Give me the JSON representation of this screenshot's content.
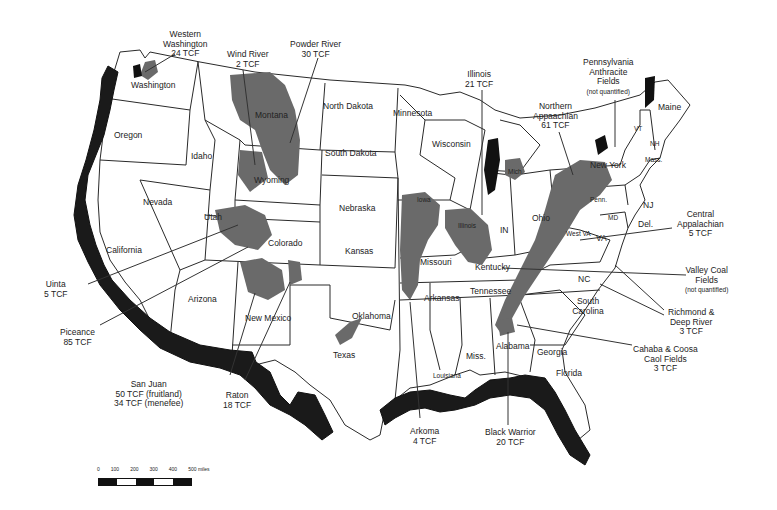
{
  "map": {
    "subject": "Coalbed methane basins of the conterminous United States",
    "states": [
      {
        "name": "Washington",
        "x": 137,
        "y": 83
      },
      {
        "name": "Oregon",
        "x": 114,
        "y": 134
      },
      {
        "name": "Idaho",
        "x": 191,
        "y": 151
      },
      {
        "name": "Montana",
        "x": 253,
        "y": 113
      },
      {
        "name": "Wyoming",
        "x": 254,
        "y": 177
      },
      {
        "name": "North Dakota",
        "x": 323,
        "y": 103
      },
      {
        "name": "South Dakota",
        "x": 325,
        "y": 150
      },
      {
        "name": "Minnesota",
        "x": 393,
        "y": 110
      },
      {
        "name": "Wisconsin",
        "x": 430,
        "y": 140
      },
      {
        "name": "Nevada",
        "x": 143,
        "y": 198
      },
      {
        "name": "Utah",
        "x": 204,
        "y": 215
      },
      {
        "name": "Colorado",
        "x": 268,
        "y": 240
      },
      {
        "name": "California",
        "x": 106,
        "y": 245
      },
      {
        "name": "Nebraska",
        "x": 339,
        "y": 205
      },
      {
        "name": "Kansas",
        "x": 345,
        "y": 248
      },
      {
        "name": "Iowa",
        "x": 417,
        "y": 196
      },
      {
        "name": "Illinois",
        "x": 458,
        "y": 222
      },
      {
        "name": "IN",
        "x": 500,
        "y": 225
      },
      {
        "name": "Ohio",
        "x": 532,
        "y": 213
      },
      {
        "name": "Missouri",
        "x": 420,
        "y": 259
      },
      {
        "name": "Kentucky",
        "x": 475,
        "y": 264
      },
      {
        "name": "Tennessee",
        "x": 470,
        "y": 288
      },
      {
        "name": "Arizona",
        "x": 188,
        "y": 297
      },
      {
        "name": "New Mexico",
        "x": 245,
        "y": 315
      },
      {
        "name": "Oklahoma",
        "x": 352,
        "y": 313
      },
      {
        "name": "Arkansas",
        "x": 424,
        "y": 295
      },
      {
        "name": "Texas",
        "x": 333,
        "y": 353
      },
      {
        "name": "Louisiana",
        "x": 433,
        "y": 372
      },
      {
        "name": "Miss.",
        "x": 470,
        "y": 353
      },
      {
        "name": "Alabama",
        "x": 501,
        "y": 344
      },
      {
        "name": "Georgia",
        "x": 537,
        "y": 350
      },
      {
        "name": "Florida",
        "x": 556,
        "y": 370
      },
      {
        "name": "South Carolina",
        "x": 567,
        "y": 299
      },
      {
        "name": "NC",
        "x": 578,
        "y": 275
      },
      {
        "name": "VA",
        "x": 594,
        "y": 234
      },
      {
        "name": "West VA",
        "x": 570,
        "y": 233
      },
      {
        "name": "Penn.",
        "x": 590,
        "y": 197
      },
      {
        "name": "New York",
        "x": 608,
        "y": 165
      },
      {
        "name": "MD",
        "x": 609,
        "y": 219
      },
      {
        "name": "Del.",
        "x": 638,
        "y": 220
      },
      {
        "name": "NJ",
        "x": 641,
        "y": 199
      },
      {
        "name": "VT",
        "x": 639,
        "y": 126
      },
      {
        "name": "NH",
        "x": 652,
        "y": 141
      },
      {
        "name": "Mass.",
        "x": 646,
        "y": 157
      },
      {
        "name": "Maine",
        "x": 667,
        "y": 105
      },
      {
        "name": "Mich.",
        "x": 510,
        "y": 170
      }
    ],
    "basins": [
      {
        "name": "Western Washington",
        "value": "24 TCF",
        "label_lines": [
          "Western",
          "Washington",
          "24 TCF"
        ]
      },
      {
        "name": "Wind River",
        "value": "2 TCF",
        "label_lines": [
          "Wind River",
          "2 TCF"
        ]
      },
      {
        "name": "Powder River",
        "value": "30 TCF",
        "label_lines": [
          "Powder River",
          "30 TCF"
        ]
      },
      {
        "name": "Illinois",
        "value": "21 TCF",
        "label_lines": [
          "Illinois",
          "21 TCF"
        ]
      },
      {
        "name": "Northern Appalachian",
        "value": "61 TCF",
        "label_lines": [
          "Northern",
          "Appaachian",
          "61 TCF"
        ]
      },
      {
        "name": "Pennsylvania Anthracite Fields",
        "value": "not quantified",
        "label_lines": [
          "Pennsylvania",
          "Anthracite",
          "Fields",
          "(not quantified)"
        ]
      },
      {
        "name": "Central Appalachian",
        "value": "5 TCF",
        "label_lines": [
          "Central",
          "Appalachian",
          "5 TCF"
        ]
      },
      {
        "name": "Valley Coal Fields",
        "value": "not quantified",
        "label_lines": [
          "Valley Coal",
          "Fields",
          "(not quantified)"
        ]
      },
      {
        "name": "Richmond & Deep River",
        "value": "3 TCF",
        "label_lines": [
          "Richmond &",
          "Deep River",
          "3 TCF"
        ]
      },
      {
        "name": "Cahaba & Coosa Coal Fields",
        "value": "3 TCF",
        "label_lines": [
          "Cahaba & Coosa",
          "Caol Fields",
          "3 TCF"
        ]
      },
      {
        "name": "Black Warrior",
        "value": "20 TCF",
        "label_lines": [
          "Black Warrior",
          "20 TCF"
        ]
      },
      {
        "name": "Arkoma",
        "value": "4 TCF",
        "label_lines": [
          "Arkoma",
          "4 TCF"
        ]
      },
      {
        "name": "Raton",
        "value": "18 TCF",
        "label_lines": [
          "Raton",
          "18 TCF"
        ]
      },
      {
        "name": "San Juan",
        "value": "50 TCF (fruitland); 34 TCF (menefee)",
        "label_lines": [
          "San Juan",
          "50 TCF (fruitland)",
          "34 TCF (menefee)"
        ]
      },
      {
        "name": "Piceance",
        "value": "85 TCF",
        "label_lines": [
          "Piceance",
          "85 TCF"
        ]
      },
      {
        "name": "Uinta",
        "value": "5 TCF",
        "label_lines": [
          "Uinta",
          "5 TCF"
        ]
      }
    ],
    "scale": {
      "ticks": [
        "0",
        "100",
        "200",
        "300",
        "400",
        "500 miles"
      ]
    },
    "colors": {
      "basin_fill": "#6a6a6a",
      "dark_fill": "#111111",
      "boundary": "#2a2a2a",
      "background": "#ffffff"
    }
  }
}
